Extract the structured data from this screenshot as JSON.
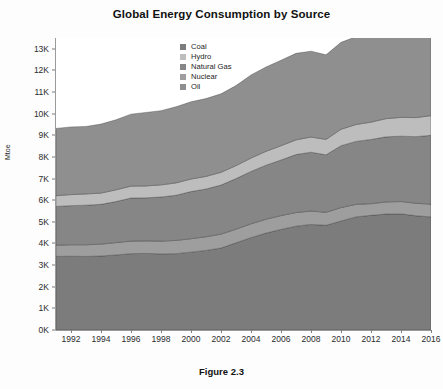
{
  "figure": {
    "caption": "Figure 2.3"
  },
  "chart_data": {
    "type": "area",
    "title": "Global Energy Consumption by Source",
    "xlabel": "",
    "ylabel": "Mtoe",
    "stacked": true,
    "grid": false,
    "legend_position": "top-center",
    "xlim": [
      1991,
      2016
    ],
    "ylim": [
      0,
      13500
    ],
    "ytick_values": [
      0,
      1000,
      2000,
      3000,
      4000,
      5000,
      6000,
      7000,
      8000,
      9000,
      10000,
      11000,
      12000,
      13000
    ],
    "ytick_labels": [
      "0K",
      "1K",
      "2K",
      "3K",
      "4K",
      "5K",
      "6K",
      "7K",
      "8K",
      "9K",
      "10K",
      "11K",
      "12K",
      "13K"
    ],
    "xtick_values": [
      1992,
      1994,
      1996,
      1998,
      2000,
      2002,
      2004,
      2006,
      2008,
      2010,
      2012,
      2014,
      2016
    ],
    "xtick_labels": [
      "1992",
      "1994",
      "1996",
      "1998",
      "2000",
      "2002",
      "2004",
      "2006",
      "2008",
      "2010",
      "2012",
      "2014",
      "2016"
    ],
    "x": [
      1991,
      1992,
      1993,
      1994,
      1995,
      1996,
      1997,
      1998,
      1999,
      2000,
      2001,
      2002,
      2003,
      2004,
      2005,
      2006,
      2007,
      2008,
      2009,
      2010,
      2011,
      2012,
      2013,
      2014,
      2015,
      2016
    ],
    "stack_order": [
      "Coal",
      "Nuclear",
      "Natural Gas",
      "Hydro",
      "Oil"
    ],
    "series": [
      {
        "name": "Coal",
        "color": "#7c7c7c",
        "values": [
          3400,
          3410,
          3400,
          3420,
          3470,
          3530,
          3540,
          3520,
          3530,
          3600,
          3680,
          3790,
          4030,
          4270,
          4480,
          4650,
          4800,
          4880,
          4840,
          5040,
          5230,
          5300,
          5360,
          5370,
          5280,
          5230
        ]
      },
      {
        "name": "Nuclear",
        "color": "#9e9e9e",
        "values": [
          520,
          530,
          540,
          550,
          570,
          580,
          580,
          590,
          610,
          620,
          630,
          640,
          630,
          640,
          640,
          640,
          630,
          620,
          600,
          620,
          580,
          540,
          560,
          570,
          580,
          590
        ]
      },
      {
        "name": "Natural Gas",
        "color": "#868686",
        "values": [
          1790,
          1810,
          1830,
          1840,
          1900,
          1990,
          1990,
          2040,
          2090,
          2180,
          2210,
          2270,
          2340,
          2420,
          2500,
          2570,
          2680,
          2720,
          2660,
          2860,
          2910,
          2970,
          3010,
          3020,
          3080,
          3180
        ]
      },
      {
        "name": "Hydro",
        "color": "#bdbdbd",
        "values": [
          500,
          510,
          520,
          520,
          540,
          550,
          550,
          560,
          570,
          580,
          580,
          590,
          600,
          620,
          640,
          660,
          680,
          700,
          710,
          760,
          780,
          800,
          840,
          870,
          880,
          910
        ]
      },
      {
        "name": "Oil",
        "color": "#8f8f8f",
        "values": [
          3110,
          3130,
          3120,
          3190,
          3240,
          3330,
          3400,
          3430,
          3520,
          3570,
          3600,
          3630,
          3700,
          3840,
          3900,
          3950,
          4000,
          3970,
          3910,
          4020,
          4060,
          4120,
          4180,
          4210,
          4330,
          4420
        ]
      }
    ],
    "totals": [
      9320,
      9390,
      9410,
      9520,
      9720,
      9980,
      10060,
      10140,
      10320,
      10550,
      10700,
      10920,
      11300,
      11790,
      12160,
      12470,
      12790,
      12890,
      12720,
      13300,
      13560,
      13730,
      13950,
      14040,
      14150,
      14330
    ]
  },
  "legend": {
    "items": [
      {
        "label": "Coal",
        "color": "#7c7c7c"
      },
      {
        "label": "Hydro",
        "color": "#bdbdbd"
      },
      {
        "label": "Natural Gas",
        "color": "#868686"
      },
      {
        "label": "Nuclear",
        "color": "#9e9e9e"
      },
      {
        "label": "Oil",
        "color": "#8f8f8f"
      }
    ]
  }
}
